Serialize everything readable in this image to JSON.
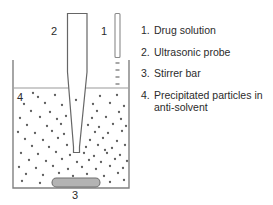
{
  "figure": {
    "background_color": "#ffffff",
    "outline_color": "#808080",
    "particle_color": "#666666",
    "stirrer_fill_color": "#b3b3b3",
    "text_color": "#2b2b2b"
  },
  "callouts": {
    "drug_solution": "1",
    "ultrasonic_probe": "2",
    "stirrer_bar": "3",
    "precipitated_particles": "4"
  },
  "legend": {
    "items": [
      {
        "number": "1.",
        "label": "Drug solution"
      },
      {
        "number": "2.",
        "label": "Ultrasonic probe"
      },
      {
        "number": "3.",
        "label": "Stirrer bar"
      },
      {
        "number": "4.",
        "label": "Precipitated particles in anti-solvent"
      }
    ]
  },
  "diagram_data": {
    "type": "schematic",
    "components": [
      {
        "name": "beaker",
        "shape": "open-top-rectangle",
        "x": 13,
        "y": 60,
        "width": 116,
        "height": 128
      },
      {
        "name": "liquid-level",
        "shape": "horizontal-line",
        "y": 88,
        "x1": 13,
        "x2": 129
      },
      {
        "name": "ultrasonic-probe",
        "shape": "tapered-rod",
        "x": 67,
        "y": 13,
        "width": 20,
        "tip_y": 152
      },
      {
        "name": "drug-solution-needle",
        "shape": "thin-rod",
        "x": 115,
        "y": 13,
        "width": 5,
        "height": 44
      },
      {
        "name": "droplets",
        "shape": "dashes",
        "count": 4,
        "x": 117,
        "y_start": 62,
        "spacing": 7
      },
      {
        "name": "stirrer-bar",
        "shape": "rounded-rect",
        "x": 52,
        "y": 178,
        "width": 48,
        "height": 9
      },
      {
        "name": "precipitated-particles",
        "shape": "dot-field",
        "count": 86,
        "region": "below-liquid-level"
      }
    ]
  }
}
